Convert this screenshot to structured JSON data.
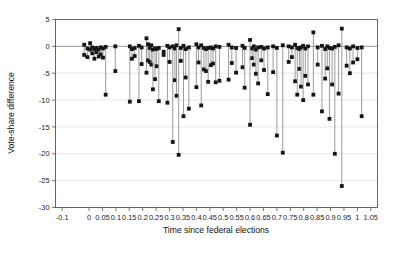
{
  "chart_data": {
    "type": "scatter",
    "title": "",
    "xlabel": "Time since federal elections",
    "ylabel": "Vote-share difference",
    "xlim": [
      -0.125,
      1.075
    ],
    "ylim": [
      -30,
      5
    ],
    "grid": true,
    "legend": null,
    "xticks": [
      -0.1,
      0,
      0.05,
      0.1,
      0.15,
      0.2,
      0.25,
      0.3,
      0.35,
      0.4,
      0.45,
      0.5,
      0.55,
      0.6,
      0.65,
      0.7,
      0.75,
      0.8,
      0.85,
      0.9,
      0.95,
      1,
      1.05
    ],
    "xticklabels": [
      "-0.1",
      "0",
      "0.05",
      "0.1",
      "0.15",
      "0.2",
      "0.25",
      "0.3",
      "0.35",
      "0.4",
      "0.45",
      "0.5",
      "0.55",
      "0.6",
      "0.65",
      "0.7",
      "0.75",
      "0.8",
      "0.85",
      "0.9",
      "0.95",
      "1",
      "1.05"
    ],
    "yticks": [
      5,
      0,
      -5,
      -10,
      -15,
      -20,
      -25,
      -30
    ],
    "yticklabels": [
      "5",
      "0",
      "-5",
      "-10",
      "-15",
      "-20",
      "-25",
      "-30"
    ],
    "marker": "square",
    "marker_color": "#151515",
    "line_color": "#8a8a8a",
    "series_note": "Each element is a vertical range segment (x, y_top, y_bottom) with square markers at both endpoints.",
    "segments": [
      {
        "x": -0.018,
        "y_top": 0.3,
        "y_bottom": -1.6
      },
      {
        "x": -0.006,
        "y_top": -0.4,
        "y_bottom": -2.0
      },
      {
        "x": 0.004,
        "y_top": 0.6,
        "y_bottom": -0.6
      },
      {
        "x": 0.012,
        "y_top": -0.2,
        "y_bottom": -1.3
      },
      {
        "x": 0.02,
        "y_top": -0.5,
        "y_bottom": -2.3
      },
      {
        "x": 0.028,
        "y_top": -0.3,
        "y_bottom": -1.1
      },
      {
        "x": 0.036,
        "y_top": -0.6,
        "y_bottom": -1.9
      },
      {
        "x": 0.044,
        "y_top": -0.2,
        "y_bottom": -1.5
      },
      {
        "x": 0.052,
        "y_top": -0.4,
        "y_bottom": -2.1
      },
      {
        "x": 0.062,
        "y_top": -0.1,
        "y_bottom": -9.0
      },
      {
        "x": 0.098,
        "y_top": 0.0,
        "y_bottom": -4.6
      },
      {
        "x": 0.152,
        "y_top": 0.0,
        "y_bottom": -10.3
      },
      {
        "x": 0.16,
        "y_top": -0.5,
        "y_bottom": -2.3
      },
      {
        "x": 0.17,
        "y_top": -0.3,
        "y_bottom": -1.8
      },
      {
        "x": 0.186,
        "y_top": 0.1,
        "y_bottom": -10.2
      },
      {
        "x": 0.196,
        "y_top": -0.2,
        "y_bottom": -3.3
      },
      {
        "x": 0.214,
        "y_top": 1.5,
        "y_bottom": -4.9
      },
      {
        "x": 0.22,
        "y_top": 0.4,
        "y_bottom": -2.6
      },
      {
        "x": 0.226,
        "y_top": -0.3,
        "y_bottom": -2.9
      },
      {
        "x": 0.232,
        "y_top": 0.2,
        "y_bottom": -3.4
      },
      {
        "x": 0.238,
        "y_top": -0.6,
        "y_bottom": -8.0
      },
      {
        "x": 0.246,
        "y_top": -0.4,
        "y_bottom": -6.1
      },
      {
        "x": 0.252,
        "y_top": -0.5,
        "y_bottom": -3.7
      },
      {
        "x": 0.26,
        "y_top": -0.3,
        "y_bottom": -10.2
      },
      {
        "x": 0.278,
        "y_top": -1.0,
        "y_bottom": -1.6
      },
      {
        "x": 0.292,
        "y_top": 0.1,
        "y_bottom": -10.5
      },
      {
        "x": 0.3,
        "y_top": -0.2,
        "y_bottom": -2.9
      },
      {
        "x": 0.312,
        "y_top": 0.0,
        "y_bottom": -17.8
      },
      {
        "x": 0.32,
        "y_top": -0.4,
        "y_bottom": -6.3
      },
      {
        "x": 0.326,
        "y_top": 0.2,
        "y_bottom": -9.2
      },
      {
        "x": 0.334,
        "y_top": 3.2,
        "y_bottom": -20.2
      },
      {
        "x": 0.342,
        "y_top": -0.3,
        "y_bottom": -2.7
      },
      {
        "x": 0.352,
        "y_top": 0.1,
        "y_bottom": -13.0
      },
      {
        "x": 0.36,
        "y_top": -0.5,
        "y_bottom": -5.8
      },
      {
        "x": 0.372,
        "y_top": -0.2,
        "y_bottom": -11.6
      },
      {
        "x": 0.4,
        "y_top": 0.4,
        "y_bottom": -7.6
      },
      {
        "x": 0.408,
        "y_top": -0.2,
        "y_bottom": -3.0
      },
      {
        "x": 0.418,
        "y_top": 0.2,
        "y_bottom": -11.0
      },
      {
        "x": 0.428,
        "y_top": -0.3,
        "y_bottom": -4.3
      },
      {
        "x": 0.436,
        "y_top": -0.5,
        "y_bottom": -4.6
      },
      {
        "x": 0.444,
        "y_top": -0.3,
        "y_bottom": -6.6
      },
      {
        "x": 0.454,
        "y_top": -0.2,
        "y_bottom": -3.5
      },
      {
        "x": 0.462,
        "y_top": -0.4,
        "y_bottom": -3.2
      },
      {
        "x": 0.472,
        "y_top": 0.0,
        "y_bottom": -6.7
      },
      {
        "x": 0.486,
        "y_top": -0.1,
        "y_bottom": -6.4
      },
      {
        "x": 0.52,
        "y_top": 0.3,
        "y_bottom": -6.2
      },
      {
        "x": 0.532,
        "y_top": -0.2,
        "y_bottom": -3.1
      },
      {
        "x": 0.548,
        "y_top": -0.3,
        "y_bottom": -4.9
      },
      {
        "x": 0.572,
        "y_top": 0.1,
        "y_bottom": -3.9
      },
      {
        "x": 0.58,
        "y_top": -0.3,
        "y_bottom": -7.7
      },
      {
        "x": 0.6,
        "y_top": 1.2,
        "y_bottom": -14.6
      },
      {
        "x": 0.608,
        "y_top": -0.4,
        "y_bottom": -2.2
      },
      {
        "x": 0.614,
        "y_top": 0.0,
        "y_bottom": -3.4
      },
      {
        "x": 0.622,
        "y_top": -0.6,
        "y_bottom": -5.1
      },
      {
        "x": 0.63,
        "y_top": -0.2,
        "y_bottom": -6.9
      },
      {
        "x": 0.642,
        "y_top": -0.1,
        "y_bottom": -2.6
      },
      {
        "x": 0.652,
        "y_top": -0.4,
        "y_bottom": -4.4
      },
      {
        "x": 0.666,
        "y_top": -0.2,
        "y_bottom": -8.9
      },
      {
        "x": 0.686,
        "y_top": 0.0,
        "y_bottom": -4.8
      },
      {
        "x": 0.7,
        "y_top": -0.3,
        "y_bottom": -16.6
      },
      {
        "x": 0.722,
        "y_top": 0.2,
        "y_bottom": -19.8
      },
      {
        "x": 0.744,
        "y_top": 0.0,
        "y_bottom": -2.9
      },
      {
        "x": 0.756,
        "y_top": -0.2,
        "y_bottom": -2.0
      },
      {
        "x": 0.768,
        "y_top": 0.3,
        "y_bottom": -6.5
      },
      {
        "x": 0.776,
        "y_top": -0.3,
        "y_bottom": -9.0
      },
      {
        "x": 0.784,
        "y_top": -0.5,
        "y_bottom": -4.2
      },
      {
        "x": 0.79,
        "y_top": -0.2,
        "y_bottom": -7.5
      },
      {
        "x": 0.798,
        "y_top": 0.1,
        "y_bottom": -10.0
      },
      {
        "x": 0.806,
        "y_top": -0.4,
        "y_bottom": -5.5
      },
      {
        "x": 0.816,
        "y_top": 0.0,
        "y_bottom": -7.1
      },
      {
        "x": 0.836,
        "y_top": 2.6,
        "y_bottom": -9.0
      },
      {
        "x": 0.852,
        "y_top": -0.2,
        "y_bottom": -3.4
      },
      {
        "x": 0.868,
        "y_top": 0.1,
        "y_bottom": -12.1
      },
      {
        "x": 0.88,
        "y_top": -0.5,
        "y_bottom": -6.0
      },
      {
        "x": 0.888,
        "y_top": 0.0,
        "y_bottom": -4.1
      },
      {
        "x": 0.896,
        "y_top": -0.3,
        "y_bottom": -13.5
      },
      {
        "x": 0.906,
        "y_top": -0.4,
        "y_bottom": -7.1
      },
      {
        "x": 0.916,
        "y_top": -0.1,
        "y_bottom": -20.0
      },
      {
        "x": 0.93,
        "y_top": 0.2,
        "y_bottom": -8.8
      },
      {
        "x": 0.942,
        "y_top": 3.3,
        "y_bottom": -26.0
      },
      {
        "x": 0.96,
        "y_top": -0.2,
        "y_bottom": -3.6
      },
      {
        "x": 0.972,
        "y_top": -0.4,
        "y_bottom": -5.0
      },
      {
        "x": 0.984,
        "y_top": 0.0,
        "y_bottom": -3.0
      },
      {
        "x": 1.0,
        "y_top": -0.3,
        "y_bottom": -2.4
      },
      {
        "x": 1.016,
        "y_top": -0.2,
        "y_bottom": -13.0
      }
    ]
  }
}
